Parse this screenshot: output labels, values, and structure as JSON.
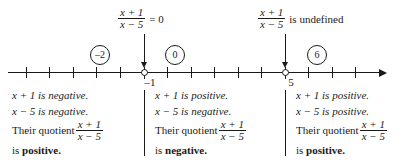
{
  "figure": {
    "type": "number-line-sign-chart",
    "expression": {
      "numerator": "x + 1",
      "denominator": "x − 5"
    }
  },
  "callouts": [
    {
      "id": "zero",
      "numerator": "x + 1",
      "denominator": "x − 5",
      "tail": "= 0",
      "points_to": "-1"
    },
    {
      "id": "undefined",
      "numerator": "x + 1",
      "denominator": "x − 5",
      "tail": "is undefined",
      "points_to": "5"
    }
  ],
  "test_values": [
    {
      "id": "neg2",
      "label": "–2",
      "value": -2
    },
    {
      "id": "zero",
      "label": "0",
      "value": 0
    },
    {
      "id": "six",
      "label": "6",
      "value": 6
    }
  ],
  "number_line": {
    "min": -7,
    "max": 9,
    "tick_values": [
      -7,
      -6,
      -5,
      -4,
      -3,
      -2,
      -1,
      0,
      1,
      2,
      3,
      4,
      5,
      6,
      7,
      8
    ],
    "key_points": [
      {
        "value": -1,
        "label": "–1",
        "marker": "crossed-circle"
      },
      {
        "value": 5,
        "label": "5",
        "marker": "crossed-circle"
      }
    ],
    "arrow_direction": "right"
  },
  "intervals": [
    {
      "id": "left",
      "lines": [
        {
          "text": "x + 1 is negative."
        },
        {
          "text": "x − 5 is negative."
        }
      ],
      "quotient_prefix": "Their quotient",
      "numerator": "x + 1",
      "denominator": "x − 5",
      "conclusion_prefix": "is",
      "conclusion": "positive.",
      "sign": "positive"
    },
    {
      "id": "middle",
      "lines": [
        {
          "text": "x + 1 is positive."
        },
        {
          "text": "x − 5 is negative."
        }
      ],
      "quotient_prefix": "Their quotient",
      "numerator": "x + 1",
      "denominator": "x − 5",
      "conclusion_prefix": "is",
      "conclusion": "negative.",
      "sign": "negative"
    },
    {
      "id": "right",
      "lines": [
        {
          "text": "x + 1 is positive."
        },
        {
          "text": "x − 5 is positive."
        }
      ],
      "quotient_prefix": "Their quotient",
      "numerator": "x + 1",
      "denominator": "x − 5",
      "conclusion_prefix": "is",
      "conclusion": "positive.",
      "sign": "positive"
    }
  ],
  "colors": {
    "ink": "#1a1a1a",
    "background": "#ffffff"
  }
}
